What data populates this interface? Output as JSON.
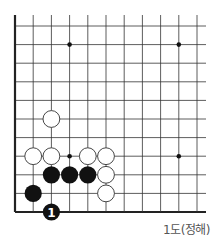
{
  "diagram": {
    "type": "go-board-fragment",
    "corner": "bottom-left",
    "grid": {
      "origin_x": 15,
      "spacing_x": 18.2,
      "cols": 11,
      "right_extent": 206,
      "bottom_y": 212,
      "spacing_y": 18.6,
      "rows": 11,
      "top_extent": 15
    },
    "star_points": [
      [
        3,
        1
      ],
      [
        9,
        1
      ],
      [
        3,
        7
      ],
      [
        9,
        7
      ]
    ],
    "stones": [
      {
        "color": "white",
        "col": 2,
        "row": 5
      },
      {
        "color": "white",
        "col": 1,
        "row": 7
      },
      {
        "color": "white",
        "col": 2,
        "row": 7
      },
      {
        "color": "white",
        "col": 4,
        "row": 7
      },
      {
        "color": "white",
        "col": 5,
        "row": 7
      },
      {
        "color": "black",
        "col": 2,
        "row": 8
      },
      {
        "color": "black",
        "col": 3,
        "row": 8
      },
      {
        "color": "black",
        "col": 4,
        "row": 8
      },
      {
        "color": "white",
        "col": 5,
        "row": 8
      },
      {
        "color": "black",
        "col": 1,
        "row": 9
      },
      {
        "color": "white",
        "col": 5,
        "row": 9
      },
      {
        "color": "black",
        "col": 2,
        "row": 10,
        "label": "1"
      }
    ],
    "caption": "1도(정해)",
    "colors": {
      "line": "#333333",
      "edge": "#222222",
      "black_stone": "#111111",
      "white_stone": "#ffffff",
      "caption": "#555555"
    }
  }
}
